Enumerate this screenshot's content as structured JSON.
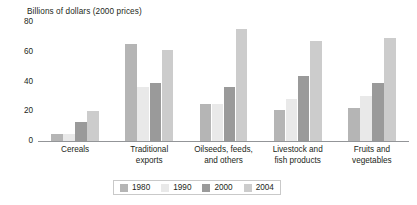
{
  "chart_data": {
    "type": "bar",
    "title": "Billions of dollars (2000 prices)",
    "xlabel": "",
    "ylabel": "Billions of dollars (2000 prices)",
    "ylim": [
      0,
      80
    ],
    "yticks": [
      0,
      20,
      40,
      60,
      80
    ],
    "grid": false,
    "legend_position": "bottom-center",
    "categories": [
      "Cereals",
      "Traditional exports",
      "Oilseeds, feeds, and others",
      "Livestock and fish products",
      "Fruits and vegetables"
    ],
    "category_label_lines": [
      [
        "Cereals"
      ],
      [
        "Traditional",
        "exports"
      ],
      [
        "Oilseeds, feeds,",
        "and others"
      ],
      [
        "Livestock and",
        "fish products"
      ],
      [
        "Fruits and",
        "vegetables"
      ]
    ],
    "series": [
      {
        "name": "1980",
        "color": "#b5b5b5",
        "values": [
          5,
          65,
          25,
          21,
          22
        ]
      },
      {
        "name": "1990",
        "color": "#e9e9e9",
        "values": [
          5,
          36,
          25,
          28,
          30
        ]
      },
      {
        "name": "2000",
        "color": "#9a9a9a",
        "values": [
          13,
          39,
          36,
          44,
          39
        ]
      },
      {
        "name": "2004",
        "color": "#cccccc",
        "values": [
          20,
          61,
          75,
          67,
          69
        ]
      }
    ]
  },
  "axis": {
    "tick_labels": [
      "80",
      "60",
      "40",
      "20",
      "0"
    ]
  },
  "legend": {
    "items": [
      {
        "label": "1980",
        "color": "#b5b5b5"
      },
      {
        "label": "1990",
        "color": "#e9e9e9"
      },
      {
        "label": "2000",
        "color": "#9a9a9a"
      },
      {
        "label": "2004",
        "color": "#cccccc"
      }
    ]
  }
}
